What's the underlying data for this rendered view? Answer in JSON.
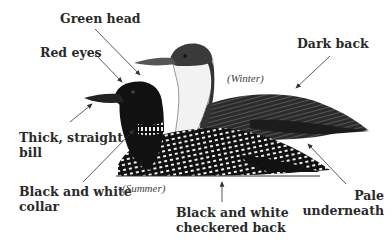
{
  "diagram": {
    "labels": {
      "green_head": "Green head",
      "red_eyes": "Red eyes",
      "dark_back": "Dark back",
      "bill_line1": "Thick, straight",
      "bill_line2": "bill",
      "collar_line1": "Black and white",
      "collar_line2": "collar",
      "checkered_line1": "Black and white",
      "checkered_line2": "checkered back",
      "pale_line1": "Pale",
      "pale_line2": "underneath"
    },
    "seasons": {
      "winter": "(Winter)",
      "summer": "(Summer)"
    },
    "colors": {
      "background": "#ffffff",
      "text": "#2a2a2a",
      "arrow": "#333333",
      "summer_bird": "#111111",
      "winter_bird_back": "#2b2b2b",
      "winter_bird_throat": "#f2f2f2"
    }
  }
}
